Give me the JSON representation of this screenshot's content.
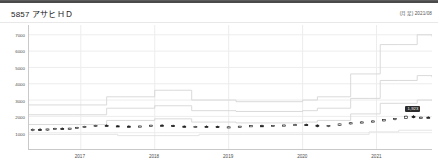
{
  "window": {
    "top_bar_color": "#4a4a4a"
  },
  "header": {
    "ticker": "5857",
    "company_name": "アサヒＨＤ",
    "title": "5857 アサヒＨＤ",
    "period_note": "(月足) 2021/08"
  },
  "colors": {
    "grid": "#ededed",
    "axis": "#c9c9c9",
    "band_line": "#d6d6d6",
    "candle_up_fill": "#ffffff",
    "candle_down_fill": "#1b1b1b",
    "candle_outline": "#1b1b1b",
    "badge_bg": "#2b2b2b",
    "badge_text": "#ffffff",
    "text": "#4d4d4d"
  },
  "annotations": [
    {
      "name": "latest-price-label",
      "text": "1,923"
    }
  ],
  "chart_data": {
    "type": "line",
    "title": "5857 アサヒＨＤ",
    "subtitle": "(月足) 2021/08",
    "xlabel": "",
    "ylabel": "",
    "grid": true,
    "legend": "none",
    "xlim": [
      2016.3,
      2021.75
    ],
    "ylim": [
      0,
      7600
    ],
    "yticks": [
      1000,
      2000,
      3000,
      4000,
      5000,
      6000,
      7000
    ],
    "ytick_labels": [
      "1000",
      "2000",
      "3000",
      "4000",
      "5000",
      "6000",
      "7000"
    ],
    "xticks": [
      2017,
      2018,
      2019,
      2020,
      2021
    ],
    "xtick_labels": [
      "2017",
      "2018",
      "2019",
      "2020",
      "2021"
    ],
    "series": [
      {
        "name": "upper-band",
        "style": "step",
        "color": "#d6d6d6",
        "x": [
          2016.3,
          2016.9,
          2017.0,
          2017.35,
          2017.6,
          2018.0,
          2018.25,
          2018.5,
          2018.75,
          2019.1,
          2019.6,
          2020.0,
          2020.2,
          2020.45,
          2020.65,
          2020.9,
          2021.05,
          2021.3,
          2021.55,
          2021.75
        ],
        "values": [
          2700,
          2700,
          2700,
          3200,
          3200,
          3600,
          3600,
          3000,
          3000,
          2900,
          2900,
          3000,
          3200,
          3200,
          4600,
          4600,
          6400,
          6400,
          7000,
          6900
        ]
      },
      {
        "name": "mid-band",
        "style": "step",
        "color": "#d6d6d6",
        "x": [
          2016.3,
          2016.9,
          2017.0,
          2017.35,
          2017.6,
          2018.0,
          2018.25,
          2018.5,
          2018.75,
          2019.1,
          2019.6,
          2020.0,
          2020.2,
          2020.45,
          2020.65,
          2020.9,
          2021.05,
          2021.3,
          2021.55,
          2021.75
        ],
        "values": [
          2100,
          2100,
          2100,
          2500,
          2500,
          2650,
          2650,
          2350,
          2350,
          2300,
          2300,
          2350,
          2500,
          2500,
          3100,
          3100,
          4200,
          4200,
          4500,
          4400
        ]
      },
      {
        "name": "lower-band",
        "style": "step",
        "color": "#d6d6d6",
        "x": [
          2016.3,
          2016.9,
          2017.0,
          2017.35,
          2017.6,
          2018.0,
          2018.25,
          2018.5,
          2018.75,
          2019.1,
          2019.6,
          2020.0,
          2020.2,
          2020.45,
          2020.65,
          2020.9,
          2021.05,
          2021.3,
          2021.55,
          2021.75
        ],
        "values": [
          1500,
          1500,
          1500,
          1750,
          1750,
          1850,
          1850,
          1650,
          1650,
          1600,
          1600,
          1650,
          1750,
          1750,
          2150,
          2150,
          2800,
          2800,
          3000,
          2950
        ]
      },
      {
        "name": "floor-band",
        "style": "step",
        "color": "#e2e2e2",
        "x": [
          2016.3,
          2017.1,
          2017.5,
          2018.1,
          2018.6,
          2019.2,
          2019.9,
          2020.4,
          2020.9,
          2021.3,
          2021.75
        ],
        "values": [
          900,
          900,
          820,
          820,
          900,
          900,
          900,
          900,
          1050,
          1150,
          1150
        ]
      }
    ],
    "candlesticks": {
      "name": "monthly-price",
      "type": "ohlc-monthly",
      "up_color": "#ffffff",
      "down_color": "#1b1b1b",
      "bars": [
        {
          "x": 2016.35,
          "open": 1150,
          "high": 1260,
          "low": 1090,
          "close": 1200,
          "dir": "up"
        },
        {
          "x": 2016.45,
          "open": 1200,
          "high": 1290,
          "low": 1150,
          "close": 1180,
          "dir": "down"
        },
        {
          "x": 2016.55,
          "open": 1180,
          "high": 1240,
          "low": 1120,
          "close": 1230,
          "dir": "up"
        },
        {
          "x": 2016.65,
          "open": 1230,
          "high": 1300,
          "low": 1190,
          "close": 1260,
          "dir": "up"
        },
        {
          "x": 2016.75,
          "open": 1260,
          "high": 1330,
          "low": 1220,
          "close": 1240,
          "dir": "down"
        },
        {
          "x": 2016.85,
          "open": 1240,
          "high": 1300,
          "low": 1190,
          "close": 1280,
          "dir": "up"
        },
        {
          "x": 2016.95,
          "open": 1280,
          "high": 1360,
          "low": 1250,
          "close": 1330,
          "dir": "up"
        },
        {
          "x": 2017.05,
          "open": 1330,
          "high": 1420,
          "low": 1300,
          "close": 1390,
          "dir": "up"
        },
        {
          "x": 2017.2,
          "open": 1390,
          "high": 1480,
          "low": 1350,
          "close": 1450,
          "dir": "up"
        },
        {
          "x": 2017.35,
          "open": 1450,
          "high": 1520,
          "low": 1400,
          "close": 1420,
          "dir": "down"
        },
        {
          "x": 2017.5,
          "open": 1420,
          "high": 1470,
          "low": 1360,
          "close": 1400,
          "dir": "down"
        },
        {
          "x": 2017.65,
          "open": 1400,
          "high": 1460,
          "low": 1340,
          "close": 1370,
          "dir": "down"
        },
        {
          "x": 2017.8,
          "open": 1370,
          "high": 1440,
          "low": 1330,
          "close": 1410,
          "dir": "up"
        },
        {
          "x": 2017.95,
          "open": 1410,
          "high": 1490,
          "low": 1380,
          "close": 1460,
          "dir": "up"
        },
        {
          "x": 2018.1,
          "open": 1460,
          "high": 1530,
          "low": 1410,
          "close": 1440,
          "dir": "down"
        },
        {
          "x": 2018.25,
          "open": 1440,
          "high": 1490,
          "low": 1370,
          "close": 1400,
          "dir": "down"
        },
        {
          "x": 2018.4,
          "open": 1400,
          "high": 1450,
          "low": 1330,
          "close": 1360,
          "dir": "down"
        },
        {
          "x": 2018.55,
          "open": 1360,
          "high": 1420,
          "low": 1310,
          "close": 1390,
          "dir": "up"
        },
        {
          "x": 2018.7,
          "open": 1390,
          "high": 1450,
          "low": 1350,
          "close": 1380,
          "dir": "down"
        },
        {
          "x": 2018.85,
          "open": 1380,
          "high": 1430,
          "low": 1300,
          "close": 1330,
          "dir": "down"
        },
        {
          "x": 2019.0,
          "open": 1330,
          "high": 1390,
          "low": 1280,
          "close": 1360,
          "dir": "up"
        },
        {
          "x": 2019.15,
          "open": 1360,
          "high": 1420,
          "low": 1320,
          "close": 1400,
          "dir": "up"
        },
        {
          "x": 2019.3,
          "open": 1400,
          "high": 1460,
          "low": 1360,
          "close": 1430,
          "dir": "up"
        },
        {
          "x": 2019.45,
          "open": 1430,
          "high": 1490,
          "low": 1390,
          "close": 1410,
          "dir": "down"
        },
        {
          "x": 2019.6,
          "open": 1410,
          "high": 1470,
          "low": 1360,
          "close": 1440,
          "dir": "up"
        },
        {
          "x": 2019.75,
          "open": 1440,
          "high": 1500,
          "low": 1400,
          "close": 1470,
          "dir": "up"
        },
        {
          "x": 2019.9,
          "open": 1470,
          "high": 1540,
          "low": 1430,
          "close": 1500,
          "dir": "up"
        },
        {
          "x": 2020.05,
          "open": 1500,
          "high": 1560,
          "low": 1420,
          "close": 1460,
          "dir": "down"
        },
        {
          "x": 2020.2,
          "open": 1460,
          "high": 1520,
          "low": 1330,
          "close": 1380,
          "dir": "down"
        },
        {
          "x": 2020.35,
          "open": 1380,
          "high": 1470,
          "low": 1340,
          "close": 1450,
          "dir": "up"
        },
        {
          "x": 2020.5,
          "open": 1450,
          "high": 1560,
          "low": 1420,
          "close": 1540,
          "dir": "up"
        },
        {
          "x": 2020.65,
          "open": 1540,
          "high": 1640,
          "low": 1500,
          "close": 1610,
          "dir": "up"
        },
        {
          "x": 2020.8,
          "open": 1610,
          "high": 1700,
          "low": 1570,
          "close": 1660,
          "dir": "up"
        },
        {
          "x": 2020.95,
          "open": 1660,
          "high": 1760,
          "low": 1620,
          "close": 1720,
          "dir": "up"
        },
        {
          "x": 2021.1,
          "open": 1720,
          "high": 1830,
          "low": 1690,
          "close": 1800,
          "dir": "up"
        },
        {
          "x": 2021.25,
          "open": 1800,
          "high": 1900,
          "low": 1760,
          "close": 1870,
          "dir": "up"
        },
        {
          "x": 2021.4,
          "open": 1870,
          "high": 2050,
          "low": 1840,
          "close": 2010,
          "dir": "up"
        },
        {
          "x": 2021.5,
          "open": 2010,
          "high": 2080,
          "low": 1880,
          "close": 1923,
          "dir": "down"
        },
        {
          "x": 2021.6,
          "open": 1923,
          "high": 1990,
          "low": 1860,
          "close": 1950,
          "dir": "up"
        },
        {
          "x": 2021.7,
          "open": 1950,
          "high": 2010,
          "low": 1900,
          "close": 1940,
          "dir": "down"
        }
      ]
    }
  }
}
